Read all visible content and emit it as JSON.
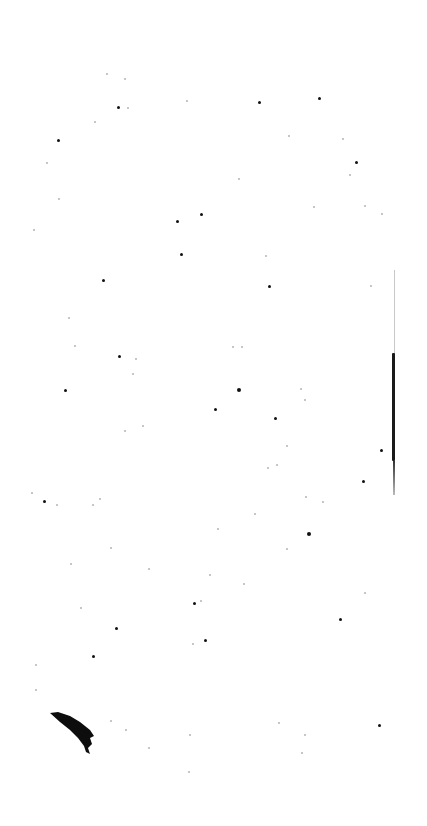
{
  "canvas": {
    "width": 427,
    "height": 826,
    "background": "#ffffff"
  },
  "marks": {
    "vertical_line": {
      "x": 394,
      "y_start": 270,
      "y_end": 495,
      "dark_start": 353,
      "dark_end": 461
    },
    "curved_blob": {
      "x": 50,
      "y": 713,
      "w": 45,
      "h": 40
    }
  },
  "specks": [
    [
      106,
      73,
      1
    ],
    [
      124,
      78,
      1
    ],
    [
      117,
      106,
      2
    ],
    [
      127,
      107,
      1
    ],
    [
      57,
      139,
      2
    ],
    [
      46,
      162,
      1
    ],
    [
      94,
      121,
      1
    ],
    [
      186,
      100,
      1
    ],
    [
      258,
      101,
      2
    ],
    [
      318,
      97,
      2
    ],
    [
      342,
      138,
      1
    ],
    [
      355,
      161,
      2
    ],
    [
      288,
      135,
      1
    ],
    [
      238,
      178,
      1
    ],
    [
      200,
      213,
      2
    ],
    [
      176,
      220,
      2
    ],
    [
      180,
      253,
      2
    ],
    [
      58,
      198,
      1
    ],
    [
      33,
      229,
      1
    ],
    [
      265,
      255,
      1
    ],
    [
      313,
      206,
      1
    ],
    [
      349,
      174,
      1
    ],
    [
      364,
      205,
      1
    ],
    [
      381,
      213,
      1
    ],
    [
      102,
      279,
      2
    ],
    [
      268,
      285,
      2
    ],
    [
      370,
      285,
      1
    ],
    [
      68,
      317,
      1
    ],
    [
      74,
      345,
      1
    ],
    [
      118,
      355,
      2
    ],
    [
      135,
      358,
      1
    ],
    [
      132,
      373,
      1
    ],
    [
      64,
      389,
      2
    ],
    [
      214,
      408,
      2
    ],
    [
      237,
      388,
      3
    ],
    [
      274,
      417,
      2
    ],
    [
      232,
      346,
      1
    ],
    [
      241,
      346,
      1
    ],
    [
      300,
      388,
      1
    ],
    [
      304,
      399,
      1
    ],
    [
      380,
      449,
      2
    ],
    [
      286,
      445,
      1
    ],
    [
      142,
      425,
      1
    ],
    [
      124,
      430,
      1
    ],
    [
      43,
      500,
      2
    ],
    [
      31,
      492,
      1
    ],
    [
      56,
      504,
      1
    ],
    [
      99,
      498,
      1
    ],
    [
      92,
      504,
      1
    ],
    [
      307,
      532,
      3
    ],
    [
      322,
      501,
      1
    ],
    [
      362,
      480,
      2
    ],
    [
      267,
      467,
      1
    ],
    [
      276,
      464,
      1
    ],
    [
      254,
      513,
      1
    ],
    [
      305,
      496,
      1
    ],
    [
      217,
      528,
      1
    ],
    [
      209,
      574,
      1
    ],
    [
      193,
      602,
      2
    ],
    [
      204,
      639,
      2
    ],
    [
      200,
      600,
      1
    ],
    [
      192,
      643,
      1
    ],
    [
      148,
      568,
      1
    ],
    [
      115,
      627,
      2
    ],
    [
      92,
      655,
      2
    ],
    [
      80,
      607,
      1
    ],
    [
      70,
      563,
      1
    ],
    [
      35,
      664,
      1
    ],
    [
      35,
      689,
      1
    ],
    [
      243,
      583,
      1
    ],
    [
      339,
      618,
      2
    ],
    [
      364,
      592,
      1
    ],
    [
      110,
      720,
      1
    ],
    [
      125,
      729,
      1
    ],
    [
      148,
      747,
      1
    ],
    [
      188,
      771,
      1
    ],
    [
      189,
      734,
      1
    ],
    [
      278,
      722,
      1
    ],
    [
      304,
      734,
      1
    ],
    [
      301,
      752,
      1
    ],
    [
      378,
      724,
      2
    ],
    [
      110,
      547,
      1
    ],
    [
      286,
      548,
      1
    ]
  ]
}
